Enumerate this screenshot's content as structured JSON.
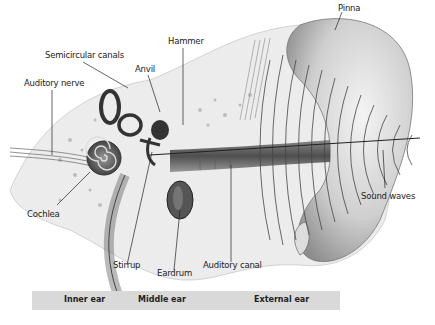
{
  "diagram": {
    "labels": {
      "pinna": "Pinna",
      "hammer": "Hammer",
      "semicircular_canals": "Semicircular canals",
      "anvil": "Anvil",
      "auditory_nerve": "Auditory nerve",
      "cochlea": "Cochlea",
      "stirrup": "Stirrup",
      "eardrum": "Eardrum",
      "auditory_canal": "Auditory canal",
      "sound_waves": "Sound waves"
    },
    "regions": [
      {
        "label": "Inner ear"
      },
      {
        "label": "Middle ear"
      },
      {
        "label": "External ear"
      }
    ],
    "colors": {
      "band": "#d9d9d9",
      "ink": "#222222",
      "tissue": "#e6e6e6",
      "shadow": "#555555"
    }
  }
}
